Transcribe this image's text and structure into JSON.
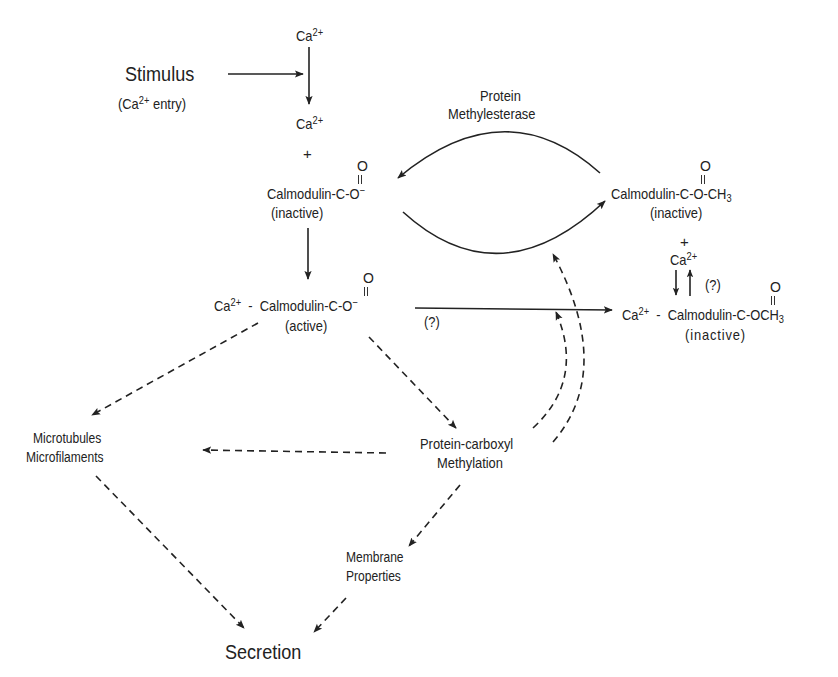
{
  "diagram": {
    "colors": {
      "ink": "#222222",
      "background": "#ffffff"
    },
    "nodes": {
      "ca_top": {
        "base": "Ca",
        "sup": "2+"
      },
      "stimulus": {
        "label": "Stimulus",
        "sub_prefix": "(Ca",
        "sub_sup": "2+",
        "sub_suffix": " entry)"
      },
      "ca_mid": {
        "base": "Ca",
        "sup": "2+"
      },
      "plus_1": "+",
      "calmodulin_inactive": {
        "name": "Calmodulin-C-O",
        "charge": "−",
        "carbonyl_o": "O",
        "state": "(inactive)"
      },
      "protein_methylesterase": {
        "line1": "Protein",
        "line2": "Methylesterase"
      },
      "calmodulin_methyl_inactive": {
        "name": "Calmodulin-C-O-CH",
        "sub": "3",
        "carbonyl_o": "O",
        "state": "(inactive)"
      },
      "plus_2": "+",
      "ca_right": {
        "base": "Ca",
        "sup": "2+"
      },
      "question_right": "(?)",
      "ca_calmodulin_active": {
        "ca_base": "Ca",
        "ca_sup": "2+",
        "dash": "-",
        "name": "Calmodulin-C-O",
        "charge": "−",
        "carbonyl_o": "O",
        "state": "(active)"
      },
      "question_mid": "(?)",
      "ca_calmodulin_methyl_inactive": {
        "ca_base": "Ca",
        "ca_sup": "2+",
        "dash": "-",
        "name": "Calmodulin-C-OCH",
        "sub": "3",
        "carbonyl_o": "O",
        "state": "(inactive)"
      },
      "microtubules": {
        "line1": "Microtubules",
        "line2": "Microfilaments"
      },
      "protein_carboxyl": {
        "line1": "Protein-carboxyl",
        "line2": "Methylation"
      },
      "membrane": {
        "line1": "Membrane",
        "line2": "Properties"
      },
      "secretion": "Secretion"
    },
    "edges": [
      {
        "from": "stimulus",
        "to": "ca_arrow",
        "style": "solid"
      },
      {
        "from": "ca_top",
        "to": "ca_mid",
        "style": "solid"
      },
      {
        "from": "calmodulin_inactive",
        "to": "ca_calmodulin_active",
        "style": "solid"
      },
      {
        "from": "calmodulin_methyl_inactive",
        "to": "calmodulin_inactive",
        "style": "solid",
        "label": "Protein Methylesterase"
      },
      {
        "from": "calmodulin_inactive",
        "to": "calmodulin_methyl_inactive",
        "style": "solid"
      },
      {
        "from": "ca_calmodulin_active",
        "to": "ca_calmodulin_methyl_inactive",
        "style": "solid",
        "label": "(?)"
      },
      {
        "from": "ca_right",
        "to": "ca_calmodulin_methyl_inactive",
        "style": "solid",
        "bidirectional": true,
        "label": "(?)"
      },
      {
        "from": "ca_calmodulin_active",
        "to": "microtubules",
        "style": "dashed"
      },
      {
        "from": "ca_calmodulin_active",
        "to": "protein_carboxyl",
        "style": "dashed"
      },
      {
        "from": "protein_carboxyl",
        "to": "microtubules",
        "style": "dashed"
      },
      {
        "from": "protein_carboxyl",
        "to": "methylation_arc",
        "style": "dashed"
      },
      {
        "from": "protein_carboxyl",
        "to": "active_to_methyl_arrow",
        "style": "dashed"
      },
      {
        "from": "protein_carboxyl",
        "to": "membrane",
        "style": "dashed"
      },
      {
        "from": "microtubules",
        "to": "secretion",
        "style": "dashed"
      },
      {
        "from": "membrane",
        "to": "secretion",
        "style": "dashed"
      }
    ]
  }
}
